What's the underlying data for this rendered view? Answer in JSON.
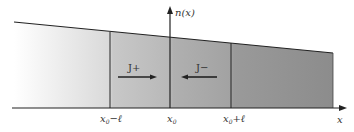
{
  "diagram": {
    "y_axis_label": "n(x)",
    "x_axis_label": "x",
    "ticks": [
      {
        "id": "left",
        "label_main": "x",
        "label_sub": "0",
        "label_suffix": "−ℓ"
      },
      {
        "id": "center",
        "label_main": "x",
        "label_sub": "0",
        "label_suffix": ""
      },
      {
        "id": "right",
        "label_main": "x",
        "label_sub": "0",
        "label_suffix": "+ℓ"
      }
    ],
    "flux_left": "J+",
    "flux_right": "J−",
    "colors": {
      "shade_light": "#ffffff",
      "shade_dark": "#8a8a8a",
      "line": "#222222"
    }
  }
}
